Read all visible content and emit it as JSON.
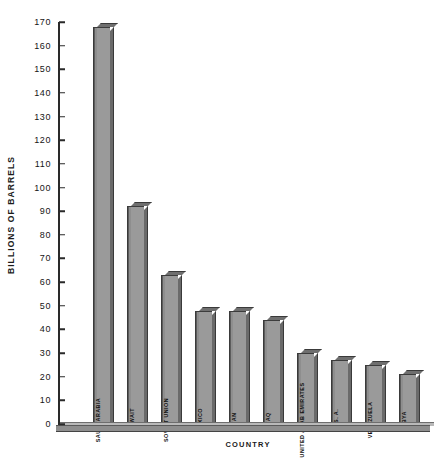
{
  "chart_data": {
    "type": "bar",
    "title": "",
    "xlabel": "COUNTRY",
    "ylabel": "BILLIONS OF BARRELS",
    "ylim": [
      0,
      170
    ],
    "ytick_step": 10,
    "yticks": [
      0,
      10,
      20,
      30,
      40,
      50,
      60,
      70,
      80,
      90,
      100,
      110,
      120,
      130,
      140,
      150,
      160,
      170
    ],
    "grid": false,
    "legend": null,
    "categories": [
      "SAUDI ARABIA",
      "KUWAIT",
      "SOVIET UNION",
      "MEXICO",
      "IRAN",
      "IRAQ",
      "UNITED ARAB EMIRATES",
      "U. S. A.",
      "VENEZUELA",
      "LIBYA"
    ],
    "values": [
      168,
      92,
      63,
      48,
      48,
      44,
      30,
      27,
      25,
      21
    ]
  },
  "style": {
    "bar_face_color": "#9a9a9a",
    "bar_side_color": "#6a6a6a",
    "bar_edge_color": "#3a3a3a",
    "axis_color": "#2a2a2a",
    "text_color": "#151515",
    "background_color": "#ffffff"
  }
}
